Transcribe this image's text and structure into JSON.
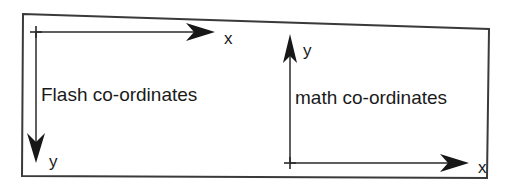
{
  "figure": {
    "name": "coordinate-systems-comparison",
    "background_color": "#ffffff",
    "ink_color": "#1a1a1a",
    "border": {
      "label": "diagram-frame",
      "color": "#3a3a3a",
      "width_px": 2
    }
  },
  "systems": [
    {
      "id": "flash",
      "caption": "Flash co-ordinates",
      "origin": {
        "x": 36,
        "y": 32
      },
      "x_axis": {
        "label": "x",
        "direction": "right",
        "label_position": {
          "x": 224,
          "y": 44
        },
        "tip": {
          "x": 215,
          "y": 32
        }
      },
      "y_axis": {
        "label": "y",
        "direction": "down",
        "label_position": {
          "x": 49,
          "y": 160
        },
        "tip": {
          "x": 36,
          "y": 160
        }
      },
      "caption_position": {
        "x": 41,
        "y": 101
      }
    },
    {
      "id": "math",
      "caption": "math co-ordinates",
      "origin": {
        "x": 290,
        "y": 163
      },
      "x_axis": {
        "label": "x",
        "direction": "right",
        "label_position": {
          "x": 478,
          "y": 173
        },
        "tip": {
          "x": 469,
          "y": 163
        }
      },
      "y_axis": {
        "label": "y",
        "direction": "up",
        "label_position": {
          "x": 303,
          "y": 56
        },
        "tip": {
          "x": 290,
          "y": 40
        }
      },
      "caption_position": {
        "x": 295,
        "y": 104
      }
    }
  ],
  "tick_marks": {
    "shape": "plus-cross",
    "size_px": 11
  }
}
